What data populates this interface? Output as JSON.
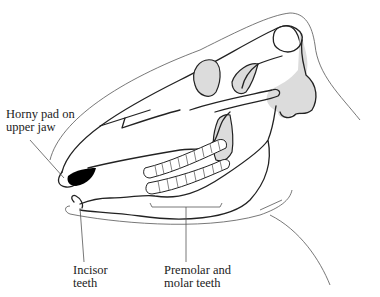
{
  "figure": {
    "labels": {
      "horny_pad_line1": "Horny pad on",
      "horny_pad_line2": "upper jaw",
      "incisor_line1": "Incisor",
      "incisor_line2": "teeth",
      "premolar_line1": "Premolar and",
      "premolar_line2": "molar teeth"
    },
    "colors": {
      "outline": "#222222",
      "shade": "#dcdcdc",
      "horny_pad": "#000000",
      "background": "#ffffff"
    }
  }
}
